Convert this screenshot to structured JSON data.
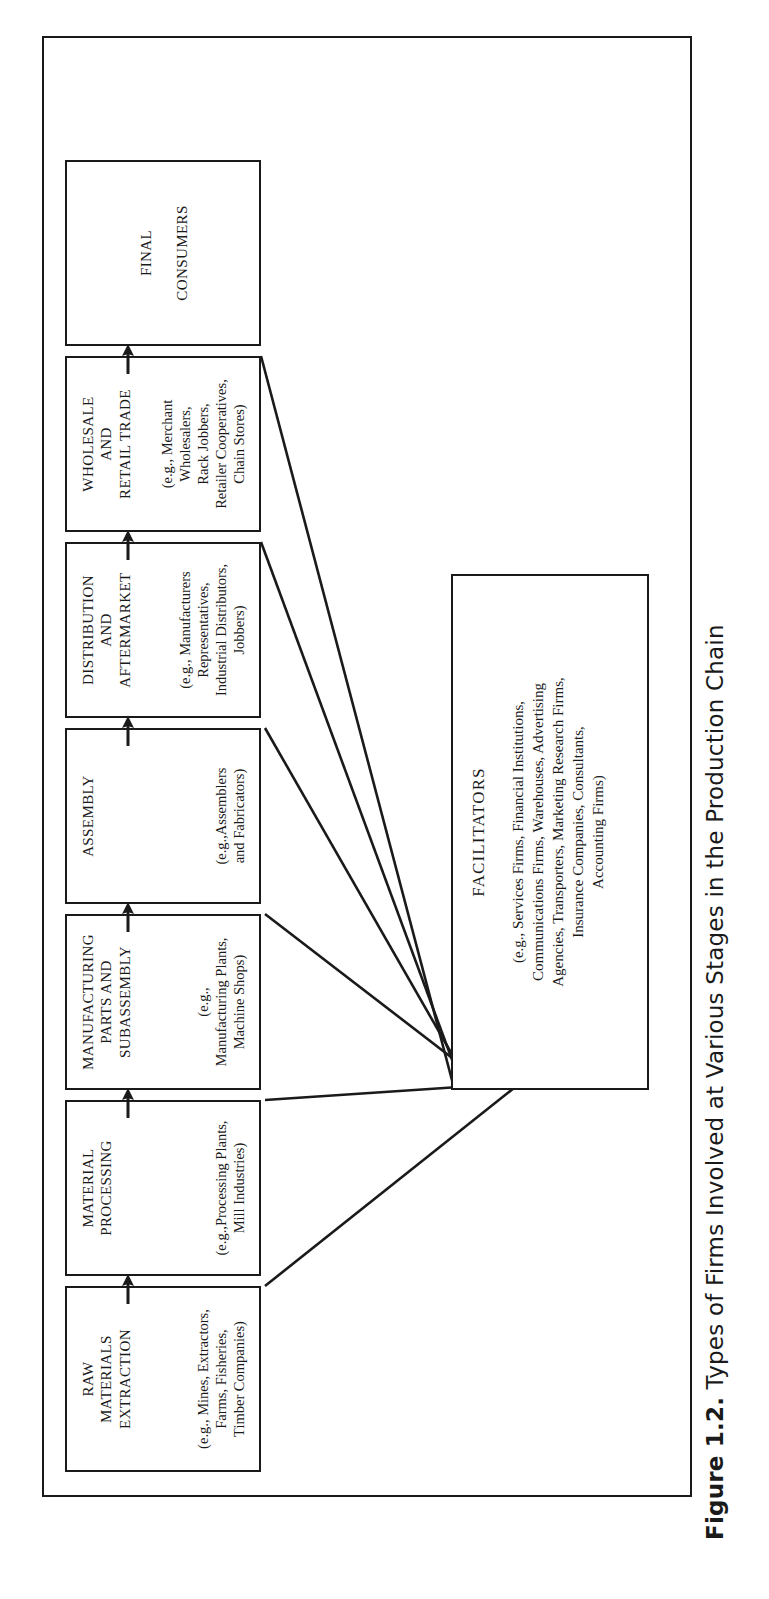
{
  "figure": {
    "caption_label": "Figure 1.2.",
    "caption_text": "Types of Firms Involved at Various Stages in the Production Chain"
  },
  "diagram": {
    "type": "flow-chain",
    "orientation": "rotated-90-on-page",
    "stages": [
      {
        "id": "raw-materials-extraction",
        "title": "RAW\nMATERIALS\nEXTRACTION",
        "examples": "(e.g., Mines, Extractors,\nFarms, Fisheries,\nTimber Companies)"
      },
      {
        "id": "material-processing",
        "title": "MATERIAL\nPROCESSING",
        "examples": "(e.g.,Processing Plants,\nMill Industries)"
      },
      {
        "id": "manufacturing-parts-and-subassembly",
        "title": "MANUFACTURING\nPARTS AND\nSUBASSEMBLY",
        "examples": "(e.g.,\nManufacturing Plants,\nMachine Shops)"
      },
      {
        "id": "assembly",
        "title": "ASSEMBLY",
        "examples": "(e.g.,Assemblers\nand Fabricators)"
      },
      {
        "id": "distribution-and-aftermarket",
        "title": "DISTRIBUTION\nAND\nAFTERMARKET",
        "examples": "(e.g., Manufacturers\nRepresentatives,\nIndustrial Distributors,\nJobbers)"
      },
      {
        "id": "wholesale-and-retail-trade",
        "title": "WHOLESALE\nAND\nRETAIL TRADE",
        "examples": "(e.g., Merchant\nWholesalers,\nRack Jobbers,\nRetailer Cooperatives,\nChain Stores)"
      },
      {
        "id": "final-consumers",
        "title": "FINAL\n\nCONSUMERS",
        "examples": ""
      }
    ],
    "facilitators": {
      "title": "FACILITATORS",
      "examples": "(e.g., Services Firms, Financial Institutions,\nCommunications Firms, Warehouses, Advertising\nAgencies, Transporters, Marketing Research Firms,\nInsurance Companies, Consultants,\nAccounting Firms)",
      "connects_to": [
        "raw-materials-extraction",
        "material-processing",
        "manufacturing-parts-and-subassembly",
        "assembly",
        "distribution-and-aftermarket",
        "wholesale-and-retail-trade"
      ]
    },
    "flow_arrows": {
      "count": 6,
      "direction": "left-to-right",
      "glyph": "arrow-up-icon"
    },
    "colors": {
      "ink": "#1a1a1a",
      "paper": "#ffffff"
    }
  }
}
